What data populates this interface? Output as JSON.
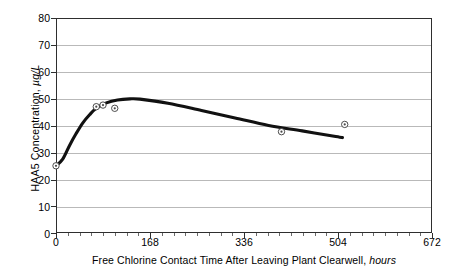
{
  "chart_data": {
    "type": "scatter",
    "title": "",
    "xlabel": "Free Chlorine Contact Time After Leaving Plant Clearwell, hours",
    "xlabel_main": "Free Chlorine Contact Time After Leaving Plant Clearwell,",
    "xlabel_unit": "hours",
    "ylabel": "HAA5  Concentration, µg/L",
    "ylabel_main": "HAA5  Concentration,",
    "ylabel_unit": "µg/L",
    "xlim": [
      0,
      672
    ],
    "ylim": [
      0,
      80
    ],
    "xticks": [
      0,
      168,
      336,
      504,
      672
    ],
    "xtick_labels": [
      "0",
      "168",
      "336",
      "504",
      "672"
    ],
    "x_minor_tick_interval": 21,
    "yticks": [
      0,
      10,
      20,
      30,
      40,
      50,
      60,
      70,
      80
    ],
    "ytick_labels": [
      "0",
      "10",
      "20",
      "30",
      "40",
      "50",
      "60",
      "70",
      "80"
    ],
    "grid": "horizontal",
    "legend": "none",
    "series": [
      {
        "name": "Measured HAA5 samples",
        "type": "scatter",
        "marker": "open-circle-with-dot",
        "points": [
          {
            "x": 0,
            "y": 25.0
          },
          {
            "x": 72,
            "y": 47.0
          },
          {
            "x": 84,
            "y": 47.6
          },
          {
            "x": 105,
            "y": 46.4
          },
          {
            "x": 403,
            "y": 37.7
          },
          {
            "x": 516,
            "y": 40.4
          }
        ]
      },
      {
        "name": "Fitted HAA5 formation curve",
        "type": "line",
        "points": [
          {
            "x": 0,
            "y": 25.0
          },
          {
            "x": 12,
            "y": 27.5
          },
          {
            "x": 24,
            "y": 32.5
          },
          {
            "x": 36,
            "y": 37.0
          },
          {
            "x": 48,
            "y": 41.0
          },
          {
            "x": 60,
            "y": 44.0
          },
          {
            "x": 72,
            "y": 46.4
          },
          {
            "x": 90,
            "y": 48.4
          },
          {
            "x": 110,
            "y": 49.5
          },
          {
            "x": 132,
            "y": 49.9
          },
          {
            "x": 150,
            "y": 49.8
          },
          {
            "x": 200,
            "y": 48.3
          },
          {
            "x": 260,
            "y": 45.6
          },
          {
            "x": 320,
            "y": 42.8
          },
          {
            "x": 380,
            "y": 40.0
          },
          {
            "x": 440,
            "y": 38.0
          },
          {
            "x": 500,
            "y": 35.9
          },
          {
            "x": 512,
            "y": 35.5
          }
        ]
      }
    ],
    "colors": {
      "line": "#111111",
      "marker_stroke": "#3a3a3a",
      "marker_fill": "#ffffff",
      "grid": "#b9b9b9",
      "axis": "#2e2e2e",
      "background": "#ffffff",
      "text": "#000000"
    }
  }
}
